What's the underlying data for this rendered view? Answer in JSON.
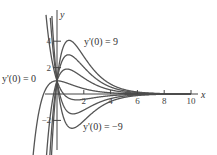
{
  "chart_data": {
    "type": "line",
    "title": "",
    "xlabel": "x",
    "ylabel": "y",
    "xlim": [
      -4,
      10
    ],
    "ylim": [
      -4,
      5.5
    ],
    "x_ticks": [
      2,
      4,
      6,
      8,
      10
    ],
    "x_tick_labels": [
      "2",
      "4",
      "6",
      "8",
      "10"
    ],
    "y_ticks": [
      4,
      2,
      -2
    ],
    "y_tick_labels": [
      "4",
      "2",
      "−2"
    ],
    "initial_value_y0": 1,
    "series": [
      {
        "name": "y'(0) = 9",
        "slope": 9
      },
      {
        "name": "y'(0) = 6",
        "slope": 6
      },
      {
        "name": "y'(0) = 3",
        "slope": 3
      },
      {
        "name": "y'(0) = 0",
        "slope": 0
      },
      {
        "name": "y'(0) = -3",
        "slope": -3
      },
      {
        "name": "y'(0) = -6",
        "slope": -6
      },
      {
        "name": "y'(0) = -9",
        "slope": -9
      }
    ],
    "annotations": [
      {
        "text": "y'(0) = 9",
        "near_series": "y'(0) = 9"
      },
      {
        "text": "y'(0) = 0",
        "near_series": "y'(0) = 0"
      },
      {
        "text": "y'(0) = −9",
        "near_series": "y'(0) = -9"
      }
    ],
    "grid": false,
    "legend": "none"
  },
  "colors": {
    "curve": "#555555",
    "axis": "#444444"
  }
}
